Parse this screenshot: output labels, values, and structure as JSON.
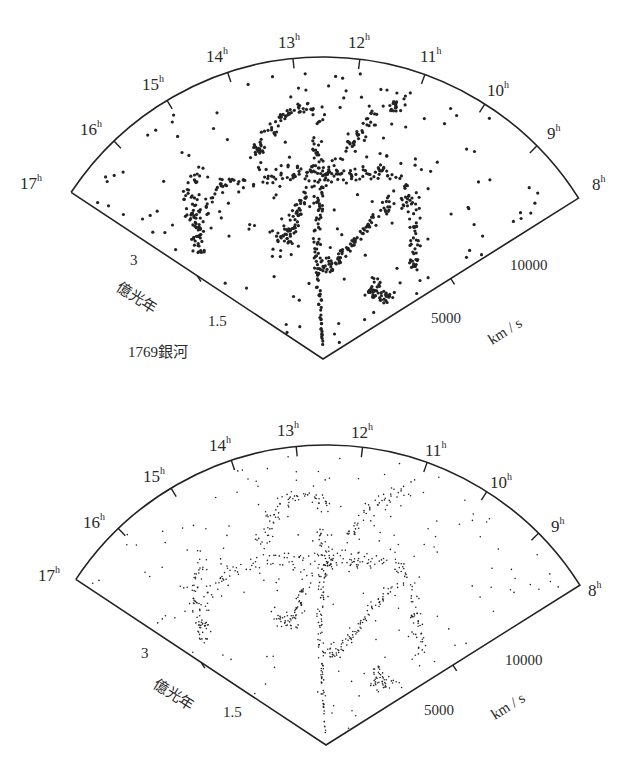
{
  "chart_data": [
    {
      "type": "scatter",
      "title": "",
      "projection": "wedge (polar: right ascension vs. recession velocity)",
      "panel": "top",
      "point_style": "large dots",
      "angular_axis": {
        "label_suffix": "h",
        "ticks": [
          "17",
          "16",
          "15",
          "14",
          "13",
          "12",
          "11",
          "10",
          "9",
          "8"
        ]
      },
      "radial_axis_velocity": {
        "unit": "km / s",
        "ticks": [
          "5000",
          "10000"
        ]
      },
      "radial_axis_distance": {
        "unit": "億光年",
        "ticks": [
          "1.5",
          "3"
        ]
      },
      "annotation": "1769銀河",
      "galaxy_count": 1769
    },
    {
      "type": "scatter",
      "title": "",
      "projection": "wedge (polar: right ascension vs. recession velocity)",
      "panel": "bottom",
      "point_style": "small dots",
      "angular_axis": {
        "label_suffix": "h",
        "ticks": [
          "17",
          "16",
          "15",
          "14",
          "13",
          "12",
          "11",
          "10",
          "9",
          "8"
        ]
      },
      "radial_axis_velocity": {
        "unit": "km / s",
        "ticks": [
          "5000",
          "10000"
        ]
      },
      "radial_axis_distance": {
        "unit": "億光年",
        "ticks": [
          "1.5",
          "3"
        ]
      }
    }
  ],
  "panels": {
    "top": {
      "hours": [
        "17",
        "16",
        "15",
        "14",
        "13",
        "12",
        "11",
        "10",
        "9",
        "8"
      ],
      "hour_suffix": "h",
      "distance_ticks": [
        "3",
        "1.5"
      ],
      "distance_unit": "億光年",
      "velocity_ticks": [
        "10000",
        "5000"
      ],
      "velocity_unit": "km / s",
      "count_label": "1769銀河"
    },
    "bottom": {
      "hours": [
        "17",
        "16",
        "15",
        "14",
        "13",
        "12",
        "11",
        "10",
        "9",
        "8"
      ],
      "hour_suffix": "h",
      "distance_ticks": [
        "3",
        "1.5"
      ],
      "distance_unit": "億光年",
      "velocity_ticks": [
        "10000",
        "5000"
      ],
      "velocity_unit": "km / s"
    }
  },
  "colors": {
    "ink": "#222222",
    "background": "#ffffff"
  }
}
